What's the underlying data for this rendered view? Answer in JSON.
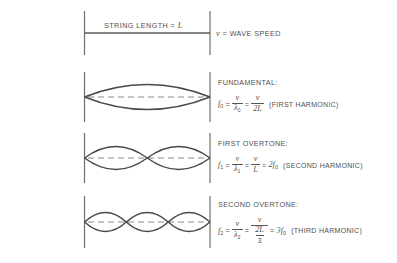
{
  "diagram": {
    "colors": {
      "curve": "#4a4a4a",
      "axis_dash": "#8a8a8a",
      "end_bar": "#6e6e6e",
      "text": "#4f4f4f",
      "background": "#ffffff"
    },
    "header": {
      "string_length_label": "STRING LENGTH =",
      "string_length_symbol": "L",
      "wave_speed_symbol": "v",
      "wave_speed_label": "= WAVE SPEED"
    },
    "rows": [
      {
        "id": "fundamental",
        "title": "FUNDAMENTAL:",
        "harmonic": "(FIRST HARMONIC)",
        "loops": 1,
        "equation": {
          "lhs": "f",
          "lhs_sub": "0",
          "eq1": "=",
          "frac1_num": "v",
          "frac1_den": "λ",
          "frac1_den_sub": "0",
          "eq2": "=",
          "frac2_num": "v",
          "frac2_den": "2L",
          "nested": false
        }
      },
      {
        "id": "first-overtone",
        "title": "FIRST OVERTONE:",
        "harmonic": "(SECOND HARMONIC)",
        "loops": 2,
        "equation": {
          "lhs": "f",
          "lhs_sub": "1",
          "eq1": "=",
          "frac1_num": "v",
          "frac1_den": "λ",
          "frac1_den_sub": "1",
          "eq2": "=",
          "frac2_num": "v",
          "frac2_den": "L",
          "eq3": "=",
          "rhs": "2f",
          "rhs_sub": "0",
          "nested": false
        }
      },
      {
        "id": "second-overtone",
        "title": "SECOND OVERTONE:",
        "harmonic": "(THIRD HARMONIC)",
        "loops": 3,
        "equation": {
          "lhs": "f",
          "lhs_sub": "2",
          "eq1": "=",
          "frac1_num": "v",
          "frac1_den": "λ",
          "frac1_den_sub": "2",
          "eq2": "=",
          "frac2_num": "v",
          "frac2_den_num": "2L",
          "frac2_den_den": "3",
          "eq3": "=",
          "rhs": "3f",
          "rhs_sub": "0",
          "nested": true
        }
      }
    ]
  }
}
